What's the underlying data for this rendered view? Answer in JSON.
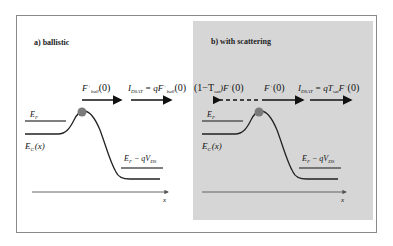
{
  "panels": [
    {
      "id": "a",
      "title": "a)  ballistic",
      "flux_labels": [
        {
          "main": "F",
          "sup": "+",
          "sub": "ball",
          "arg": "(0)"
        },
        {
          "main": "I",
          "sub": "DSAT",
          "eq": " = qF",
          "sup2": "+",
          "sub2": "ball",
          "arg": "(0)"
        }
      ],
      "ef_label": "E",
      "ef_sub": "F",
      "ec_label": "E",
      "ec_sub": "C",
      "ec_arg": "(x)",
      "drain_label": "E",
      "drain_sub": "F",
      "drain_rest": " − qV",
      "drain_sub2": "DS",
      "x_label": "x"
    },
    {
      "id": "b",
      "title": "b) with scattering",
      "flux_labels": [
        {
          "text": "(1−T",
          "sub": "sat",
          "rest": ")F",
          "sup": "+",
          "arg": "(0)"
        },
        {
          "main": "F",
          "sup": "+",
          "arg": "(0)"
        },
        {
          "main": "I",
          "sub": "DSAT",
          "eq": " = qT",
          "sub2": "sat",
          "rest": "F",
          "sup2": "+",
          "arg": "(0)"
        }
      ],
      "ef_label": "E",
      "ef_sub": "F",
      "ec_label": "E",
      "ec_sub": "C",
      "ec_arg": "(x)",
      "drain_label": "E",
      "drain_sub": "F",
      "drain_rest": " − qV",
      "drain_sub2": "DS",
      "x_label": "x"
    }
  ],
  "colors": {
    "panel_b_bg": "#d6d6d6",
    "dot": "#7a7a7a",
    "line": "#222222",
    "level": "#555555"
  }
}
